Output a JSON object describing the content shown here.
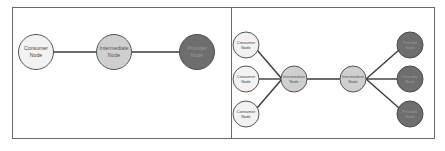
{
  "colors": {
    "frame": "#6a6a6a",
    "edge": "#3a3a3a",
    "consumer_fill": "#f2f2f2",
    "intermediate_fill": "#cfcfcf",
    "provider_fill": "#6e6e6e",
    "node_stroke": "#555555",
    "light_text": "#444444",
    "dark_text": "#9a9a9a"
  },
  "left_panel": {
    "nodes": [
      {
        "id": "consumer",
        "line1": "Consumer",
        "line2": "Node",
        "type": "consumer"
      },
      {
        "id": "intermediate",
        "line1": "Intermediate",
        "line2": "Node",
        "type": "intermediate"
      },
      {
        "id": "provider",
        "line1": "Provider",
        "line2": "Node",
        "type": "provider"
      }
    ]
  },
  "right_panel": {
    "nodes": [
      {
        "id": "consumer-1",
        "line1": "Consumer",
        "line2": "Node",
        "type": "consumer"
      },
      {
        "id": "consumer-2",
        "line1": "Consumer",
        "line2": "Node",
        "type": "consumer"
      },
      {
        "id": "consumer-3",
        "line1": "Consumer",
        "line2": "Node",
        "type": "consumer"
      },
      {
        "id": "intermediate-1",
        "line1": "Intermediate",
        "line2": "Node",
        "type": "intermediate"
      },
      {
        "id": "intermediate-2",
        "line1": "Intermediate",
        "line2": "Node",
        "type": "intermediate"
      },
      {
        "id": "provider-1",
        "line1": "Provider",
        "line2": "Node",
        "type": "provider"
      },
      {
        "id": "provider-2",
        "line1": "Provider",
        "line2": "Node",
        "type": "provider"
      },
      {
        "id": "provider-3",
        "line1": "Provider",
        "line2": "Node",
        "type": "provider"
      }
    ]
  }
}
